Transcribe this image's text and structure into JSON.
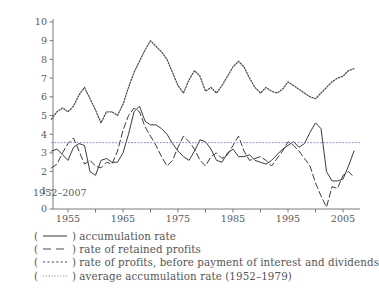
{
  "chart_data": {
    "type": "line",
    "title": "",
    "xlabel": "",
    "ylabel": "",
    "xlim": [
      1952,
      2008
    ],
    "ylim": [
      0,
      10
    ],
    "yticks": [
      0,
      1,
      2,
      3,
      4,
      5,
      6,
      7,
      8,
      9,
      10
    ],
    "xticks": [
      1955,
      1960,
      1965,
      1970,
      1975,
      1980,
      1985,
      1990,
      1995,
      2000,
      2005
    ],
    "xtick_labels_shown": [
      "1955",
      "1965",
      "1975",
      "1985",
      "1995",
      "2005"
    ],
    "grid": false,
    "legend_position": "below",
    "annotation": "1952–2007",
    "x": [
      1952,
      1953,
      1954,
      1955,
      1956,
      1957,
      1958,
      1959,
      1960,
      1961,
      1962,
      1963,
      1964,
      1965,
      1966,
      1967,
      1968,
      1969,
      1970,
      1971,
      1972,
      1973,
      1974,
      1975,
      1976,
      1977,
      1978,
      1979,
      1980,
      1981,
      1982,
      1983,
      1984,
      1985,
      1986,
      1987,
      1988,
      1989,
      1990,
      1991,
      1992,
      1993,
      1994,
      1995,
      1996,
      1997,
      1998,
      1999,
      2000,
      2001,
      2002,
      2003,
      2004,
      2005,
      2006,
      2007
    ],
    "series": [
      {
        "name": "accumulation rate",
        "style": "solid",
        "color": "#3c3c3c",
        "values": [
          3.1,
          3.2,
          2.9,
          2.6,
          3.3,
          3.5,
          3.4,
          2.0,
          1.8,
          2.6,
          2.7,
          2.5,
          2.5,
          3.0,
          4.0,
          5.2,
          5.5,
          4.7,
          4.5,
          4.5,
          4.3,
          4.0,
          3.5,
          3.1,
          2.8,
          2.6,
          3.1,
          3.7,
          3.6,
          3.2,
          2.6,
          2.5,
          3.0,
          3.2,
          2.8,
          2.8,
          2.9,
          2.6,
          2.5,
          2.4,
          2.6,
          2.9,
          3.2,
          3.4,
          3.6,
          3.3,
          3.5,
          4.1,
          4.6,
          4.3,
          2.0,
          1.5,
          1.5,
          1.6,
          2.3,
          3.1
        ]
      },
      {
        "name": "rate of retained profits",
        "style": "dashed",
        "color": "#3c3c3c",
        "values": [
          2.2,
          2.4,
          3.0,
          3.5,
          3.8,
          3.1,
          2.4,
          2.6,
          2.3,
          2.2,
          2.5,
          2.4,
          3.1,
          4.2,
          5.0,
          5.4,
          5.2,
          4.4,
          3.9,
          3.4,
          2.8,
          2.3,
          2.6,
          3.3,
          3.9,
          3.6,
          3.2,
          2.6,
          2.3,
          2.8,
          3.0,
          2.7,
          2.9,
          3.4,
          3.9,
          3.1,
          2.6,
          2.7,
          2.8,
          2.6,
          2.3,
          2.7,
          3.1,
          3.6,
          3.4,
          3.1,
          2.7,
          2.3,
          1.4,
          0.7,
          0.1,
          1.2,
          1.1,
          1.8,
          2.0,
          1.7
        ]
      },
      {
        "name": "rate of profits, before payment of interest and dividends",
        "style": "dotted-dense",
        "color": "#4a4a4a",
        "values": [
          4.8,
          5.2,
          5.4,
          5.2,
          5.5,
          6.1,
          6.5,
          5.9,
          5.3,
          4.6,
          5.2,
          5.2,
          5.0,
          5.6,
          6.5,
          7.3,
          7.9,
          8.5,
          9.0,
          8.7,
          8.4,
          8.0,
          7.3,
          6.6,
          6.2,
          6.9,
          7.4,
          7.1,
          6.3,
          6.5,
          6.2,
          6.6,
          7.1,
          7.6,
          7.9,
          7.6,
          7.0,
          6.5,
          6.2,
          6.5,
          6.3,
          6.2,
          6.4,
          6.8,
          6.6,
          6.4,
          6.2,
          6.0,
          5.9,
          6.2,
          6.5,
          6.8,
          7.0,
          7.1,
          7.4,
          7.5
        ]
      },
      {
        "name": "average accumulation rate (1952–1979)",
        "style": "dotted",
        "color": "#8a8acd",
        "constant": 3.55,
        "x_from": 1952,
        "x_to": 2008
      }
    ]
  },
  "axis": {
    "y_labels": [
      "10",
      "9",
      "8",
      "7",
      "6",
      "5",
      "4",
      "3",
      "2",
      "1",
      "0"
    ],
    "x_labels": [
      "1955",
      "1965",
      "1975",
      "1985",
      "1995",
      "2005"
    ]
  },
  "legend": {
    "items": [
      {
        "marker": "solid-line-marker",
        "label": "accumulation rate"
      },
      {
        "marker": "dashed-line-marker",
        "label": "rate of retained profits"
      },
      {
        "marker": "dashdot-line-marker",
        "label": "rate of profits, before payment of interest and dividends"
      },
      {
        "marker": "dotted-line-marker",
        "label": "average accumulation rate (1952–1979)"
      }
    ],
    "open_paren": "(",
    "close_paren": ")"
  }
}
